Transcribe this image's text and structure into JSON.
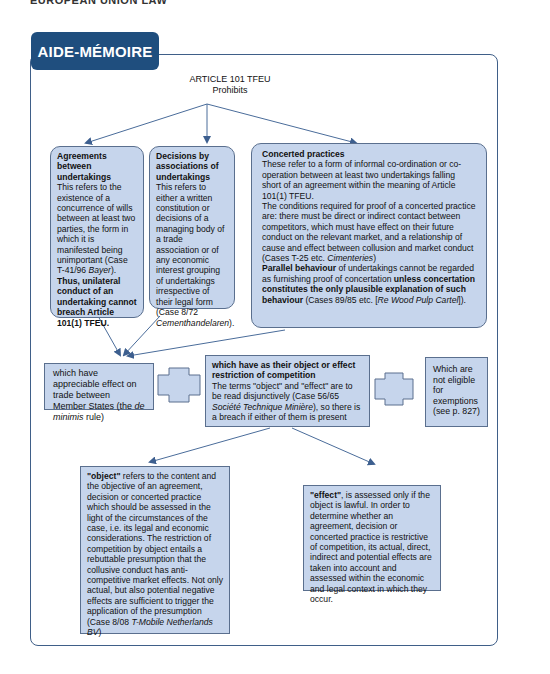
{
  "running_head": "EUROPEAN UNION LAW",
  "tab_label": "AIDE-MÉMOIRE",
  "root": {
    "line1": "ARTICLE 101 TFEU",
    "line2": "Prohibits"
  },
  "agreements": {
    "heading": "Agreements between undertakings",
    "body": "This refers to the existence of a concurrence of wills between at least two parties, the form in which it is manifested being unimportant (Case T-41/96 ",
    "case": "Bayer",
    "body_end": ").",
    "bold_end": "Thus, unilateral conduct of an undertaking cannot breach Article 101(1) TFEU."
  },
  "decisions": {
    "heading": "Decisions by associations of undertakings",
    "body": "This refers to either a written constitution or decisions of a managing body of a trade association or of any economic interest grouping of undertakings irrespective of their legal form (Case 8/72 ",
    "case": "Cementhandelaren",
    "body_end": ")."
  },
  "concerted": {
    "heading": "Concerted practices",
    "p1": "These refer to a form of informal co-ordination or co-operation between at least two undertakings falling short of an agreement within the meaning of Article 101(1) TFEU.",
    "p2": "The conditions required for proof of a concerted practice are: there must be direct or indirect contact between competitors, which must have effect on their future conduct on the relevant market, and a relationship of cause and effect between collusion and market conduct (Cases T-25 etc. ",
    "p2_case": "Cimenteries",
    "p2_end": ")",
    "p3_bold1": "Parallel behaviour",
    "p3_text1": " of undertakings cannot be regarded  as furnishing proof of concertation ",
    "p3_bold2": "unless concertation constitutes the only plausible explanation of such behaviour",
    "p3_text2": " (Cases 89/85 etc. [",
    "p3_case": "Re Wood Pulp Cartel",
    "p3_end": "])."
  },
  "appreciable": {
    "text": "which have appreciable effect on trade between Member States (the ",
    "italic": "de minimis",
    "text_end": " rule)"
  },
  "restriction": {
    "heading": "which have as their object or effect restriction of competition",
    "body": "The terms \"object\" and \"effect\" are to be read disjunctively (Case 56/65 ",
    "case": "Société Technique Minière",
    "body_end": "), so there is a breach if either of them is present"
  },
  "exemptions": {
    "text": "Which are not eligible for exemptions (see p. 827)"
  },
  "object": {
    "bold": "\"object\"",
    "body": " refers to the content and the objective of an agreement, decision or concerted practice which should be assessed in the light of the circumstances of the case, i.e. its legal and economic considerations. The restriction of competition by object entails a rebuttable presumption that the collusive conduct has anti-competitive market effects. Not only actual, but also potential negative effects are sufficient to trigger the application of the presumption (Case 8/08 ",
    "case": "T-Mobile Netherlands BV",
    "body_end": ")"
  },
  "effect": {
    "bold": "\"effect\"",
    "body": ", is assessed only if the object is lawful. In order to determine whether an agreement, decision or concerted practice is restrictive of competition, its actual, direct, indirect and potential effects are taken into account and assessed within the economic and legal context in which they occur."
  },
  "colors": {
    "tab": "#1f4e7e",
    "box_fill": "#c6d5ec",
    "box_border": "#5a6f8e",
    "arrow": "#4a6c9a"
  }
}
